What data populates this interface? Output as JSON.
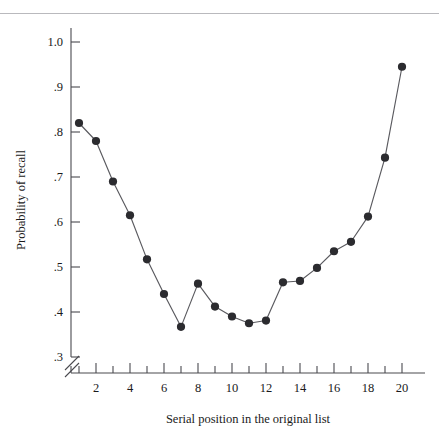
{
  "chart_data": {
    "type": "line",
    "title": "",
    "subtitle": "",
    "xlabel": "Serial position in the original list",
    "ylabel": "Probability of recall",
    "x": [
      1,
      2,
      3,
      4,
      5,
      6,
      7,
      8,
      9,
      10,
      11,
      12,
      13,
      14,
      15,
      16,
      17,
      18,
      19,
      20
    ],
    "values": [
      0.82,
      0.78,
      0.69,
      0.615,
      0.517,
      0.44,
      0.367,
      0.463,
      0.412,
      0.39,
      0.375,
      0.381,
      0.466,
      0.469,
      0.498,
      0.535,
      0.556,
      0.612,
      0.743,
      0.945
    ],
    "series": [
      {
        "name": "Probability of recall",
        "values": [
          0.82,
          0.78,
          0.69,
          0.615,
          0.517,
          0.44,
          0.367,
          0.463,
          0.412,
          0.39,
          0.375,
          0.381,
          0.466,
          0.469,
          0.498,
          0.535,
          0.556,
          0.612,
          0.743,
          0.945
        ]
      }
    ],
    "xlim": [
      1,
      20
    ],
    "ylim": [
      0.3,
      1.0
    ],
    "xticks": [
      1,
      2,
      3,
      4,
      5,
      6,
      7,
      8,
      9,
      10,
      11,
      12,
      13,
      14,
      15,
      16,
      17,
      18,
      19,
      20
    ],
    "xtick_labels": [
      "",
      "2",
      "",
      "4",
      "",
      "6",
      "",
      "8",
      "",
      "10",
      "",
      "12",
      "",
      "14",
      "",
      "16",
      "",
      "18",
      "",
      "20"
    ],
    "yticks": [
      0.3,
      0.4,
      0.5,
      0.6,
      0.7,
      0.8,
      0.9,
      1.0
    ],
    "ytick_labels": [
      ".3",
      ".4",
      ".5",
      ".6",
      ".7",
      ".8",
      ".9",
      "1.0"
    ],
    "grid": false,
    "legend": false,
    "legend_position": "none",
    "axis_break": {
      "axis": "y",
      "symbol": "double-slash",
      "below_value": 0.3
    },
    "marker": "filled-circle",
    "colors": {
      "line": "#5a5a5f",
      "marker": "#2b2b2f",
      "axis": "#4a4a4f",
      "text": "#1a1a1a",
      "background": "#ffffff",
      "rule": "#b9b9bd"
    }
  },
  "ylabel": {
    "text": "Probability of recall"
  },
  "xlabel": {
    "text": "Serial position in the original list"
  },
  "ytick_labels": {
    "t0": "1.0",
    "t1": ".9",
    "t2": ".8",
    "t3": ".7",
    "t4": ".6",
    "t5": ".5",
    "t6": ".4",
    "t7": ".3"
  },
  "xtick_labels": {
    "t2": "2",
    "t4": "4",
    "t6": "6",
    "t8": "8",
    "t10": "10",
    "t12": "12",
    "t14": "14",
    "t16": "16",
    "t18": "18",
    "t20": "20"
  }
}
